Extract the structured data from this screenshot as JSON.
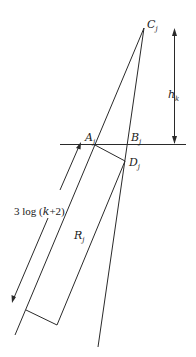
{
  "diagram": {
    "type": "geometric-construction",
    "colors": {
      "stroke": "#2a2a2a",
      "background": "#ffffff"
    },
    "labels": {
      "C": "C",
      "C_sub": "j",
      "A": "A",
      "A_sub": "j",
      "B": "B",
      "B_sub": "j",
      "D": "D",
      "D_sub": "j",
      "R": "R",
      "R_sub": "j",
      "h": "h",
      "h_sub": "k",
      "length_prefix": "3 log (",
      "length_var": "k",
      "length_suffix": "+2)"
    }
  }
}
